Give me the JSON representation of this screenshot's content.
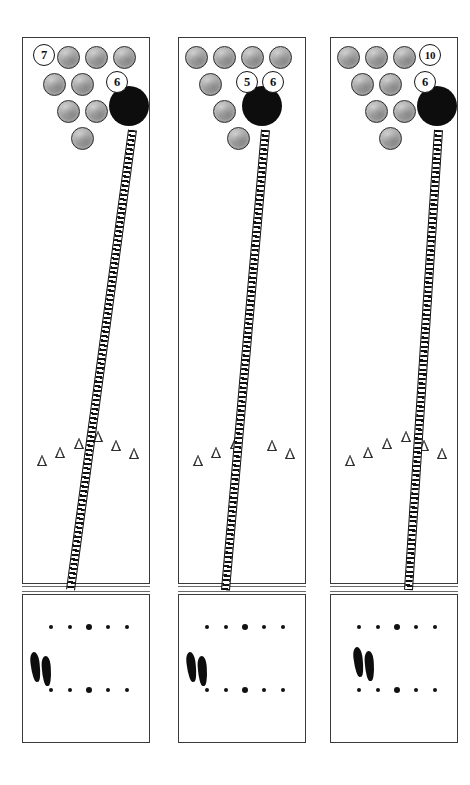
{
  "diagram": {
    "type": "bowling-lane-panels",
    "colors": {
      "ball": "#0d0d0d",
      "pin_fill": "#b4b4b4",
      "pin_stroke": "#2b2b2b",
      "lane_border": "#3a3a3a",
      "path": "#101010",
      "background": "#ffffff"
    }
  },
  "panels": [
    {
      "id": "panel-1",
      "badges": [
        {
          "label": "7",
          "x": 10,
          "y": 6,
          "name": "pin-number-7"
        },
        {
          "label": "6",
          "x": 83,
          "y": 33,
          "name": "pin-number-6"
        }
      ],
      "pins": [
        {
          "x": 34,
          "y": 8
        },
        {
          "x": 62,
          "y": 8
        },
        {
          "x": 90,
          "y": 8
        },
        {
          "x": 20,
          "y": 35
        },
        {
          "x": 48,
          "y": 35
        },
        {
          "x": 34,
          "y": 62
        },
        {
          "x": 62,
          "y": 62
        },
        {
          "x": 48,
          "y": 89
        }
      ],
      "ball": {
        "x": 86,
        "y": 48
      },
      "path": {
        "x1": 108,
        "y1": 92,
        "x2": 46,
        "y2": 552
      },
      "arrows": [
        {
          "x": 14,
          "y": 32
        },
        {
          "x": 32,
          "y": 24
        },
        {
          "x": 51,
          "y": 15
        },
        {
          "x": 70,
          "y": 8
        },
        {
          "x": 88,
          "y": 17
        },
        {
          "x": 106,
          "y": 25
        }
      ],
      "approach": {
        "dots_top": [
          28,
          47,
          66,
          85,
          104
        ],
        "dots_bottom": [
          28,
          47,
          66,
          85,
          104
        ],
        "big_index": 2,
        "feet": {
          "x": 8,
          "y": 57
        }
      }
    },
    {
      "id": "panel-2",
      "badges": [
        {
          "label": "5",
          "x": 57,
          "y": 33,
          "name": "pin-number-5"
        },
        {
          "label": "6",
          "x": 83,
          "y": 33,
          "name": "pin-number-6"
        }
      ],
      "pins": [
        {
          "x": 6,
          "y": 8
        },
        {
          "x": 34,
          "y": 8
        },
        {
          "x": 62,
          "y": 8
        },
        {
          "x": 90,
          "y": 8
        },
        {
          "x": 20,
          "y": 35
        },
        {
          "x": 34,
          "y": 62
        },
        {
          "x": 48,
          "y": 89
        }
      ],
      "ball": {
        "x": 63,
        "y": 48
      },
      "path": {
        "x1": 85,
        "y1": 92,
        "x2": 45,
        "y2": 552
      },
      "arrows": [
        {
          "x": 14,
          "y": 32
        },
        {
          "x": 32,
          "y": 24
        },
        {
          "x": 51,
          "y": 15
        },
        {
          "x": 88,
          "y": 17
        },
        {
          "x": 106,
          "y": 25
        }
      ],
      "approach": {
        "dots_top": [
          28,
          47,
          66,
          85,
          104
        ],
        "dots_bottom": [
          28,
          47,
          66,
          85,
          104
        ],
        "big_index": 2,
        "feet": {
          "x": 8,
          "y": 57
        }
      }
    },
    {
      "id": "panel-3",
      "badges": [
        {
          "label": "10",
          "x": 88,
          "y": 6,
          "name": "pin-number-10"
        },
        {
          "label": "6",
          "x": 83,
          "y": 33,
          "name": "pin-number-6"
        }
      ],
      "pins": [
        {
          "x": 6,
          "y": 8
        },
        {
          "x": 34,
          "y": 8
        },
        {
          "x": 62,
          "y": 8
        },
        {
          "x": 20,
          "y": 35
        },
        {
          "x": 48,
          "y": 35
        },
        {
          "x": 34,
          "y": 62
        },
        {
          "x": 62,
          "y": 62
        },
        {
          "x": 48,
          "y": 89
        }
      ],
      "ball": {
        "x": 86,
        "y": 48
      },
      "path": {
        "x1": 106,
        "y1": 92,
        "x2": 76,
        "y2": 552
      },
      "arrows": [
        {
          "x": 14,
          "y": 32
        },
        {
          "x": 32,
          "y": 24
        },
        {
          "x": 51,
          "y": 15
        },
        {
          "x": 70,
          "y": 8
        },
        {
          "x": 88,
          "y": 17
        },
        {
          "x": 106,
          "y": 25
        }
      ],
      "approach": {
        "dots_top": [
          28,
          47,
          66,
          85,
          104
        ],
        "dots_bottom": [
          28,
          47,
          66,
          85,
          104
        ],
        "big_index": 2,
        "feet": {
          "x": 23,
          "y": 52
        }
      }
    }
  ],
  "layout": {
    "panel_lefts": [
      22,
      178,
      330
    ],
    "panel_top": 37,
    "panel_width": 128,
    "lane_height": 547,
    "approach_top": 557,
    "approach_height": 149
  }
}
